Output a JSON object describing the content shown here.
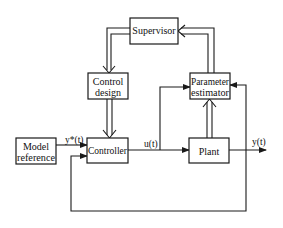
{
  "diagram": {
    "type": "block-diagram",
    "blocks": {
      "supervisor": {
        "label": "Supervisor"
      },
      "control_design": {
        "line1": "Control",
        "line2": "design"
      },
      "parameter_estimator": {
        "line1": "Parameter",
        "line2": "estimator"
      },
      "model_reference": {
        "line1": "Model",
        "line2": "reference"
      },
      "controller": {
        "label": "Controller"
      },
      "plant": {
        "label": "Plant"
      }
    },
    "signals": {
      "reference": "y*(t)",
      "control": "u(t)",
      "output": "y(t)"
    },
    "edges": [
      {
        "from": "supervisor",
        "to": "control_design",
        "style": "double"
      },
      {
        "from": "parameter_estimator",
        "to": "supervisor",
        "style": "double"
      },
      {
        "from": "control_design",
        "to": "controller",
        "style": "double"
      },
      {
        "from": "plant",
        "to": "parameter_estimator",
        "style": "double"
      },
      {
        "from": "model_reference",
        "to": "controller",
        "label": "y*(t)"
      },
      {
        "from": "controller",
        "to": "plant",
        "label": "u(t)"
      },
      {
        "from": "controller",
        "to": "parameter_estimator",
        "label": "u(t)"
      },
      {
        "from": "plant",
        "to": "output",
        "label": "y(t)"
      },
      {
        "from": "plant",
        "to": "parameter_estimator",
        "label": "y(t)"
      },
      {
        "from": "plant",
        "to": "controller",
        "label": "feedback"
      }
    ]
  }
}
